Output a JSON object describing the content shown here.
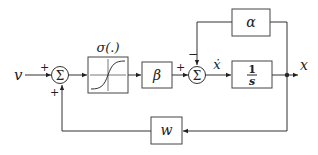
{
  "diagram": {
    "type": "block-diagram",
    "input": {
      "label": "v"
    },
    "output": {
      "label": "x"
    },
    "summing_junctions": [
      {
        "id": "sum1",
        "symbol": "Σ",
        "signs": {
          "left": "+",
          "bottom": "+"
        }
      },
      {
        "id": "sum2",
        "symbol": "Σ",
        "signs": {
          "left": "+",
          "top": "−"
        }
      }
    ],
    "blocks": [
      {
        "id": "sigma",
        "label": "σ(.)",
        "content": "sigmoid-curve"
      },
      {
        "id": "beta",
        "label": "β"
      },
      {
        "id": "integrator",
        "numerator": "1",
        "denominator": "s"
      },
      {
        "id": "alpha",
        "label": "α"
      },
      {
        "id": "w",
        "label": "w"
      }
    ],
    "signals": [
      {
        "label": "ẋ",
        "from": "sum2",
        "to": "integrator"
      }
    ],
    "signs": {
      "plus": "+",
      "minus": "−"
    }
  }
}
